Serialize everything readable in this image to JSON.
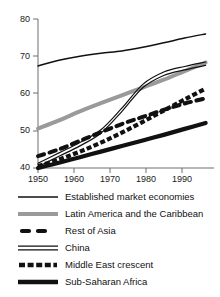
{
  "chart_data": {
    "type": "line",
    "title": "",
    "subtitle": "",
    "xlabel": "",
    "ylabel": "",
    "xlim": [
      1950,
      1992
    ],
    "ylim": [
      40,
      80
    ],
    "xticks": [
      1950,
      1960,
      1970,
      1980,
      1990
    ],
    "yticks": [
      40,
      50,
      60,
      70,
      80
    ],
    "xtick_labels": [
      "1950",
      "1960",
      "1970",
      "1980",
      "1990"
    ],
    "ytick_labels": [
      "40",
      "50",
      "60",
      "70",
      "80"
    ],
    "grid": false,
    "legend_position": "below",
    "x": [
      1950,
      1955,
      1960,
      1965,
      1970,
      1975,
      1980,
      1985,
      1990
    ],
    "series": [
      {
        "name": "Established market economies",
        "style": "solid-thin",
        "color": "#111111",
        "values": [
          67.4,
          68.9,
          70.0,
          70.8,
          71.4,
          72.4,
          73.6,
          74.9,
          76.0
        ]
      },
      {
        "name": "Latin America and the Caribbean",
        "style": "solid-thick-gray",
        "color": "#9a9a9a",
        "values": [
          50.6,
          52.8,
          55.2,
          57.4,
          59.5,
          61.6,
          63.7,
          66.0,
          68.3
        ]
      },
      {
        "name": "Rest of Asia",
        "style": "dashed-long",
        "color": "#111111",
        "values": [
          43.2,
          45.0,
          47.3,
          49.6,
          51.8,
          53.7,
          55.6,
          57.3,
          58.7
        ]
      },
      {
        "name": "China",
        "style": "double-line",
        "color": "#111111",
        "values": [
          40.8,
          43.6,
          46.4,
          49.8,
          55.6,
          62.0,
          65.3,
          66.8,
          68.0
        ]
      },
      {
        "name": "Middle East crescent",
        "style": "dashed-short",
        "color": "#111111",
        "values": [
          40.5,
          42.3,
          44.4,
          46.8,
          49.5,
          52.4,
          55.4,
          58.4,
          61.3
        ]
      },
      {
        "name": "Sub-Saharan Africa",
        "style": "solid-thick-black",
        "color": "#111111",
        "values": [
          40.0,
          41.4,
          42.9,
          44.4,
          45.9,
          47.4,
          48.9,
          50.5,
          52.1
        ]
      }
    ]
  },
  "axis": {
    "y_labels": [
      "80",
      "70",
      "60",
      "50",
      "40"
    ],
    "x_labels": [
      "1950",
      "1960",
      "1970",
      "1980",
      "1990"
    ]
  },
  "legend": {
    "items": [
      {
        "label": "Established market economies",
        "swatch": "line-solid-thin-swatch"
      },
      {
        "label": "Latin America and the Caribbean",
        "swatch": "line-solid-thick-gray-swatch"
      },
      {
        "label": "Rest of Asia",
        "swatch": "line-dashed-long-swatch"
      },
      {
        "label": "China",
        "swatch": "line-double-swatch"
      },
      {
        "label": "Middle East crescent",
        "swatch": "line-dashed-short-swatch"
      },
      {
        "label": "Sub-Saharan Africa",
        "swatch": "line-solid-thick-black-swatch"
      }
    ]
  },
  "colors": {
    "axis": "#6f6f6f",
    "ink": "#111111",
    "gray_series": "#9a9a9a",
    "background": "#ffffff"
  }
}
